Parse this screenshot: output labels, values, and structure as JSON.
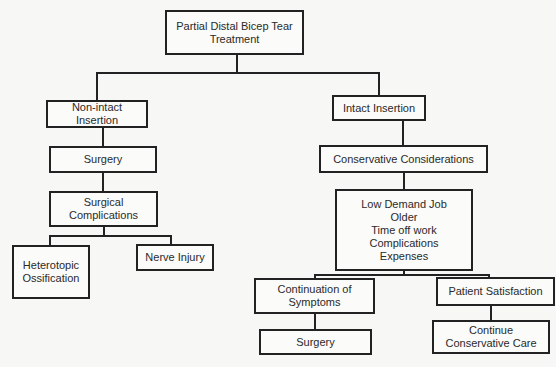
{
  "diagram": {
    "type": "tree",
    "root": {
      "label": "Partial Distal Bicep Tear\nTreatment"
    },
    "left_branch": {
      "insertion": "Non-intact Insertion",
      "surgery": "Surgery",
      "complications": "Surgical\nComplications",
      "complication_children": [
        "Heterotopic\nOssification",
        "Nerve Injury"
      ]
    },
    "right_branch": {
      "insertion": "Intact Insertion",
      "considerations": "Conservative Considerations",
      "factors": "Low Demand Job\nOlder\nTime off work\nComplications\nExpenses",
      "outcomes": {
        "continuation": "Continuation of\nSymptoms",
        "continuation_result": "Surgery",
        "satisfaction": "Patient Satisfaction",
        "satisfaction_result": "Continue\nConservative Care"
      }
    }
  }
}
